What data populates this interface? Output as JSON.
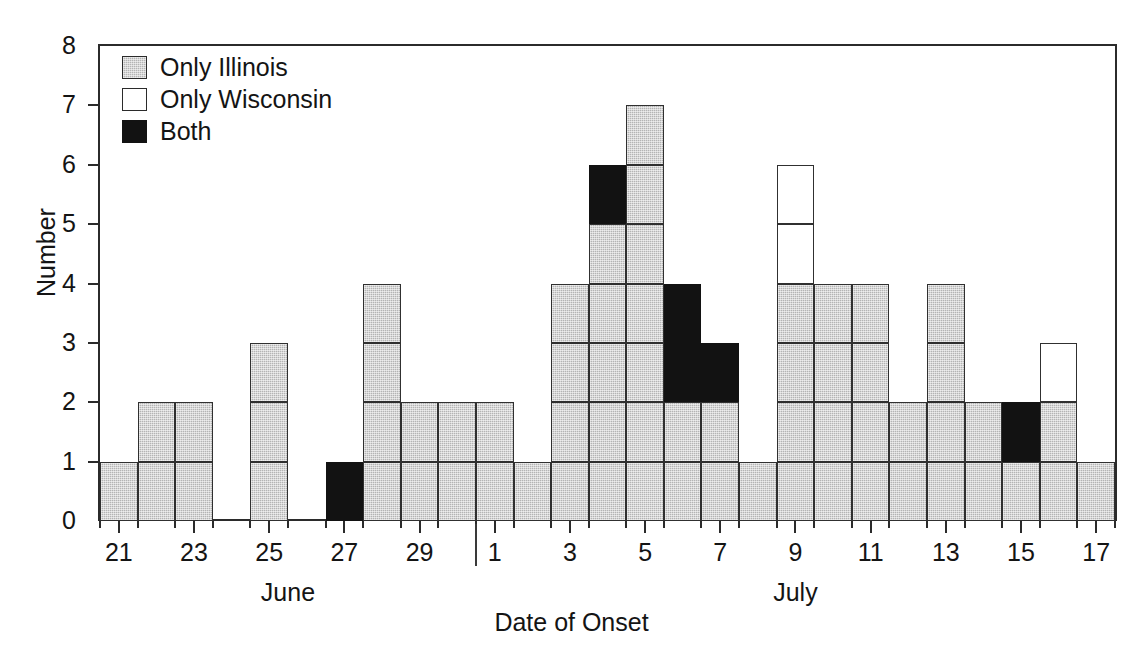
{
  "chart_data": {
    "type": "bar",
    "title": "",
    "subtitle": "",
    "xlabel": "Date of Onset",
    "ylabel": "Number",
    "ylim": [
      0,
      8
    ],
    "ytick_labels": [
      "0",
      "1",
      "2",
      "3",
      "4",
      "5",
      "6",
      "7",
      "8"
    ],
    "grid": false,
    "stacked": true,
    "legend_position": "top-left",
    "legend": [
      {
        "label": "Only Illinois",
        "key": "illinois",
        "color": "#b4b4b4",
        "swatch": "gray-hatched"
      },
      {
        "label": "Only Wisconsin",
        "key": "wisconsin",
        "color": "#ffffff",
        "swatch": "white"
      },
      {
        "label": "Both",
        "key": "both",
        "color": "#121212",
        "swatch": "black"
      }
    ],
    "month_groups": [
      {
        "label": "June",
        "start_day": 21,
        "end_day": 30
      },
      {
        "label": "July",
        "start_day": 1,
        "end_day": 17
      }
    ],
    "month_separator_after_index": 9,
    "categories": [
      "June 21",
      "June 22",
      "June 23",
      "June 24",
      "June 25",
      "June 26",
      "June 27",
      "June 28",
      "June 29",
      "June 30",
      "July 1",
      "July 2",
      "July 3",
      "July 4",
      "July 5",
      "July 6",
      "July 7",
      "July 8",
      "July 9",
      "July 10",
      "July 11",
      "July 12",
      "July 13",
      "July 14",
      "July 15",
      "July 16",
      "July 17"
    ],
    "xtick_labels": [
      {
        "day": "21",
        "index": 0
      },
      {
        "day": "23",
        "index": 2
      },
      {
        "day": "25",
        "index": 4
      },
      {
        "day": "27",
        "index": 6
      },
      {
        "day": "29",
        "index": 8
      },
      {
        "day": "1",
        "index": 10
      },
      {
        "day": "3",
        "index": 12
      },
      {
        "day": "5",
        "index": 14
      },
      {
        "day": "7",
        "index": 16
      },
      {
        "day": "9",
        "index": 18
      },
      {
        "day": "11",
        "index": 20
      },
      {
        "day": "13",
        "index": 22
      },
      {
        "day": "15",
        "index": 24
      },
      {
        "day": "17",
        "index": 26
      }
    ],
    "series": [
      {
        "name": "Only Illinois",
        "key": "illinois",
        "values": [
          1,
          2,
          2,
          0,
          3,
          0,
          0,
          4,
          2,
          2,
          2,
          1,
          4,
          5,
          7,
          2,
          2,
          1,
          4,
          4,
          4,
          2,
          4,
          2,
          1,
          2,
          1
        ]
      },
      {
        "name": "Both",
        "key": "both",
        "values": [
          0,
          0,
          0,
          0,
          0,
          0,
          1,
          0,
          0,
          0,
          0,
          0,
          0,
          1,
          0,
          2,
          1,
          0,
          0,
          0,
          0,
          0,
          0,
          0,
          1,
          0,
          0
        ]
      },
      {
        "name": "Only Wisconsin",
        "key": "wisconsin",
        "values": [
          0,
          0,
          0,
          0,
          0,
          0,
          0,
          0,
          0,
          0,
          0,
          0,
          0,
          0,
          0,
          0,
          0,
          0,
          2,
          0,
          0,
          0,
          0,
          0,
          0,
          1,
          0
        ]
      }
    ],
    "totals": [
      1,
      2,
      2,
      0,
      3,
      0,
      1,
      4,
      2,
      2,
      2,
      1,
      4,
      6,
      7,
      4,
      3,
      1,
      6,
      4,
      4,
      2,
      4,
      2,
      2,
      3,
      1
    ]
  }
}
